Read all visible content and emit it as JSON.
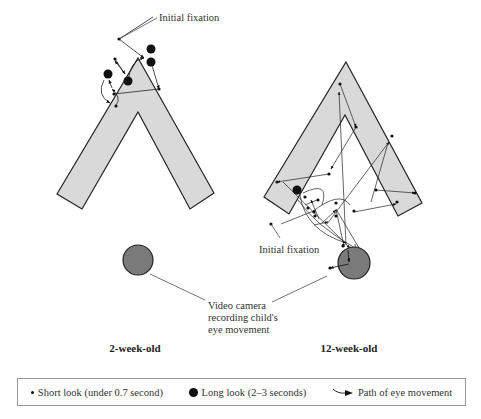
{
  "figure": {
    "left_panel": {
      "caption": "2-week-old",
      "initial_fixation_label": "Initial fixation"
    },
    "right_panel": {
      "caption": "12-week-old",
      "initial_fixation_label": "Initial fixation"
    },
    "camera_label": [
      "Video camera",
      "recording child's",
      "eye movement"
    ],
    "colors": {
      "shape_fill": "#d9d9d9",
      "shape_stroke": "#222222",
      "camera_fill": "#7a7a7a",
      "fixation": "#111111"
    }
  },
  "legend": {
    "short_look": "Short look (under 0.7 second)",
    "long_look": "Long look (2–3 seconds)",
    "path": "Path of eye movement"
  }
}
